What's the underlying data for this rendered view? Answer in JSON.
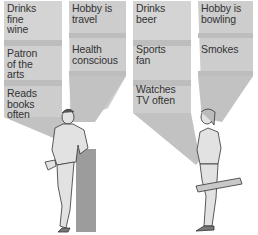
{
  "colors": {
    "panel_light": "#d2d2d2",
    "panel_dark": "#bcbcbc",
    "beam": "#c4c4c4",
    "pillar": "#9c9c9c",
    "figure_fill": "#e2e2e2",
    "outline": "#333333",
    "text": "#333333"
  },
  "left_person": {
    "description": "Man in blazer leaning on pillar",
    "traits": {
      "col1": [
        "Drinks\nfine\nwine",
        "Patron\nof the\narts",
        "Reads\nbooks\noften"
      ],
      "col2": [
        "Hobby is\ntravel",
        "Health\nconscious"
      ]
    }
  },
  "right_person": {
    "description": "Man in work clothes holding a plank",
    "traits": {
      "col1": [
        "Drinks\nbeer",
        "Sports\nfan",
        "Watches\nTV often"
      ],
      "col2": [
        "Hobby is\nbowling",
        "Smokes"
      ]
    }
  }
}
